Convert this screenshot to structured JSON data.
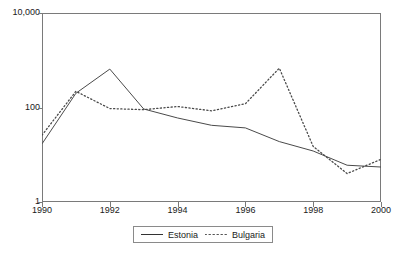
{
  "chart_data": {
    "type": "line",
    "title": "",
    "subtitle": "",
    "xlabel": "",
    "ylabel": "",
    "x": [
      1990,
      1991,
      1992,
      1993,
      1994,
      1995,
      1996,
      1997,
      1998,
      1999,
      2000
    ],
    "xtick_labels": [
      "1990",
      "1992",
      "1994",
      "1996",
      "1998",
      "2000"
    ],
    "xtick_values": [
      1990,
      1992,
      1994,
      1996,
      1998,
      2000
    ],
    "xlim": [
      1990,
      2000
    ],
    "ytick_labels": [
      "10,000",
      "100",
      "1"
    ],
    "ytick_values": [
      10000,
      100,
      1
    ],
    "ylim": [
      1,
      10000
    ],
    "yscale": "log",
    "grid": false,
    "legend_position": "bottom-center",
    "series": [
      {
        "name": "Estonia",
        "style": "solid",
        "color": "#4a4a4a",
        "values": [
          17,
          200,
          650,
          93,
          60,
          42,
          37,
          19,
          12,
          6,
          5.5
        ]
      },
      {
        "name": "Bulgaria",
        "style": "dotted",
        "color": "#4a4a4a",
        "values": [
          26,
          220,
          95,
          90,
          105,
          85,
          120,
          680,
          15,
          4,
          8
        ]
      }
    ]
  },
  "axes": {
    "ytick_labels": [
      "10,000",
      "100",
      "1"
    ],
    "xtick_labels": [
      "1990",
      "1992",
      "1994",
      "1996",
      "1998",
      "2000"
    ]
  },
  "legend": {
    "items": [
      {
        "label": "Estonia",
        "style": "solid"
      },
      {
        "label": "Bulgaria",
        "style": "dotted"
      }
    ]
  },
  "colors": {
    "line": "#4a4a4a",
    "axis": "#7a7a7a",
    "text": "#1a1a1a",
    "background": "#ffffff"
  }
}
